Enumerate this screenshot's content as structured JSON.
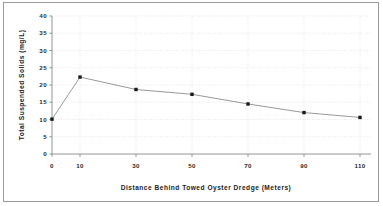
{
  "chart_data": {
    "type": "line",
    "title": "",
    "xlabel": "Distance  Behind  Towed  Oyster  Dredge  (Meters)",
    "ylabel": "Total  Suspended  Solids  (mg/L)",
    "x": [
      0,
      10,
      30,
      50,
      70,
      90,
      110
    ],
    "values": [
      10.1,
      22.3,
      18.7,
      17.3,
      14.5,
      12.0,
      10.6
    ],
    "series": [
      {
        "name": "Total Suspended Solids",
        "values": [
          10.1,
          22.3,
          18.7,
          17.3,
          14.5,
          12.0,
          10.6
        ]
      }
    ],
    "xtick_labels": [
      "0",
      "10",
      "30",
      "50",
      "70",
      "90",
      "110"
    ],
    "ytick_labels": [
      "0",
      "5",
      "10",
      "15",
      "20",
      "25",
      "30",
      "35",
      "40"
    ],
    "ytick_values": [
      0,
      5,
      10,
      15,
      20,
      25,
      30,
      35,
      40
    ],
    "xlim": [
      0,
      120
    ],
    "ylim": [
      0,
      40
    ],
    "grid": "horizontal-and-vertical-dotted",
    "legend": "none",
    "marker": "filled-square",
    "marker_color": "#1a1a1a",
    "line_color": "#8c8c8c",
    "grid_color": "#c9c9c9",
    "axis_color": "#8a8a8a",
    "background_color": "#ffffff"
  },
  "axes": {
    "x_title": "Distance  Behind  Towed  Oyster  Dredge  (Meters)",
    "y_title": "Total  Suspended  Solids  (mg/L)"
  },
  "ticks": {
    "x": [
      {
        "label": "0"
      },
      {
        "label": "10"
      },
      {
        "label": "30"
      },
      {
        "label": "50"
      },
      {
        "label": "70"
      },
      {
        "label": "90"
      },
      {
        "label": "110"
      }
    ],
    "y": [
      {
        "label": "0"
      },
      {
        "label": "5"
      },
      {
        "label": "10"
      },
      {
        "label": "15"
      },
      {
        "label": "20"
      },
      {
        "label": "25"
      },
      {
        "label": "30"
      },
      {
        "label": "35"
      },
      {
        "label": "40"
      }
    ]
  }
}
